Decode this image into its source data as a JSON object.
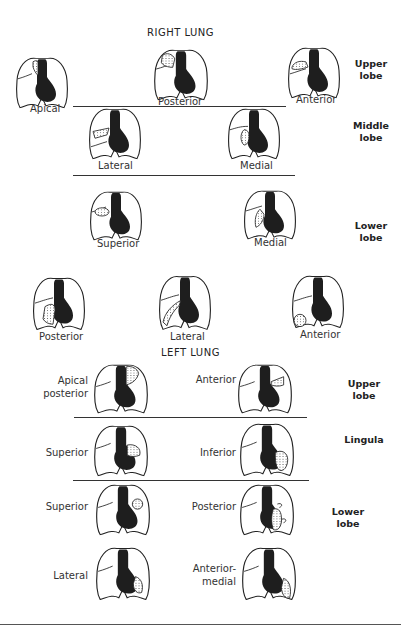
{
  "right_lung": {
    "title": "RIGHT LUNG",
    "upper_lobe": {
      "label": "Upper lobe",
      "segments": [
        {
          "name": "Apical"
        },
        {
          "name": "Posterior"
        },
        {
          "name": "Anterior"
        }
      ]
    },
    "middle_lobe": {
      "label": "Middle lobe",
      "segments": [
        {
          "name": "Lateral"
        },
        {
          "name": "Medial"
        }
      ]
    },
    "lower_lobe": {
      "label": "Lower lobe",
      "segments": [
        {
          "name": "Superior"
        },
        {
          "name": "Medial"
        },
        {
          "name": "Posterior"
        },
        {
          "name": "Lateral"
        },
        {
          "name": "Anterior"
        }
      ]
    }
  },
  "left_lung": {
    "title": "LEFT LUNG",
    "upper_lobe": {
      "label": "Upper lobe",
      "segments": [
        {
          "name": "Apical posterior",
          "line1": "Apical",
          "line2": "posterior"
        },
        {
          "name": "Anterior"
        }
      ]
    },
    "lingula": {
      "label": "Lingula",
      "segments": [
        {
          "name": "Superior"
        },
        {
          "name": "Inferior"
        }
      ]
    },
    "lower_lobe": {
      "label": "Lower lobe",
      "segments": [
        {
          "name": "Superior"
        },
        {
          "name": "Posterior"
        },
        {
          "name": "Lateral"
        },
        {
          "name": "Anterior-medial",
          "line1": "Anterior-",
          "line2": "medial"
        }
      ]
    }
  },
  "lobe_labels": {
    "upper_1": "Upper",
    "upper_2": "lobe",
    "middle_1": "Middle",
    "middle_2": "lobe",
    "lower_1": "Lower",
    "lower_2": "lobe",
    "left_upper_1": "Upper",
    "left_upper_2": "lobe",
    "lingula": "Lingula",
    "left_lower_1": "Lower",
    "left_lower_2": "lobe"
  },
  "colors": {
    "ink": "#1e1e1e",
    "background": "#ffffff"
  }
}
